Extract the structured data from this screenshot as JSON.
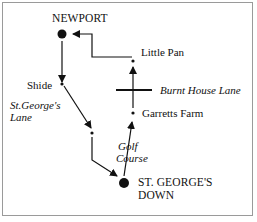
{
  "diagram": {
    "type": "route-map",
    "places": [
      {
        "id": "newport",
        "label": "NEWPORT",
        "marker": "large-dot"
      },
      {
        "id": "shide",
        "label": "Shide",
        "marker": "small-dot"
      },
      {
        "id": "st_georges_down",
        "label_line1": "ST. GEORGE'S",
        "label_line2": "DOWN",
        "marker": "large-dot"
      },
      {
        "id": "garretts_farm",
        "label": "Garretts Farm",
        "marker": "small-dot"
      },
      {
        "id": "little_pan",
        "label": "Little Pan",
        "marker": "small-dot"
      }
    ],
    "roads": [
      {
        "id": "st_georges_lane",
        "label_line1": "St.George's",
        "label_line2": "Lane"
      },
      {
        "id": "burnt_house_lane",
        "label": "Burnt House Lane"
      },
      {
        "id": "golf_course",
        "label_line1": "Golf",
        "label_line2": "Course"
      }
    ],
    "route": [
      "NEWPORT",
      "Shide",
      "St.George's Lane",
      "ST. GEORGE'S DOWN",
      "Garretts Farm",
      "Little Pan",
      "NEWPORT"
    ]
  }
}
